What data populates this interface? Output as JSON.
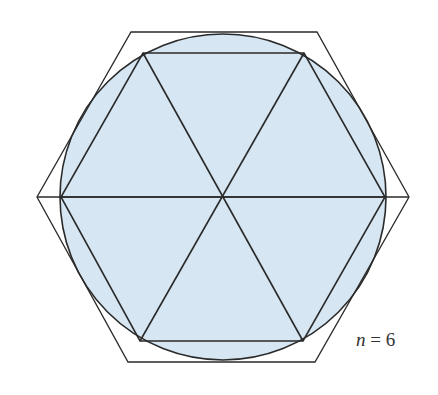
{
  "figure": {
    "label": {
      "variable": "n",
      "equals": " = ",
      "value": "6"
    },
    "colors": {
      "fill": "#d6e7f3",
      "stroke": "#2a2a2a",
      "background": "#ffffff"
    },
    "circle": {
      "cx": 223,
      "cy": 197,
      "r": 163
    },
    "outer_hexagon": "131,32 317,32 409,197 315,362 128,362 37,197",
    "inner_hexagon": "143,53 304,53 385,197 303,341 140,341 61,197",
    "diagonals": [
      {
        "x1": 143,
        "y1": 53,
        "x2": 303,
        "y2": 341
      },
      {
        "x1": 304,
        "y1": 53,
        "x2": 140,
        "y2": 341
      },
      {
        "x1": 61,
        "y1": 197,
        "x2": 385,
        "y2": 197
      }
    ],
    "outer_horizontal": {
      "x1": 37,
      "y1": 197,
      "x2": 409,
      "y2": 197
    }
  }
}
